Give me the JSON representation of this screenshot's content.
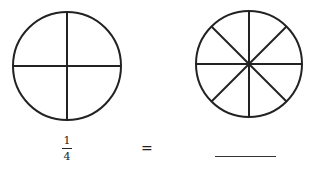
{
  "diagram": {
    "circles": [
      {
        "id": "quarters",
        "divisions": 4,
        "stroke": "#222222"
      },
      {
        "id": "eighths",
        "divisions": 8,
        "stroke": "#222222"
      }
    ],
    "equation": {
      "numerator": "1",
      "denominator": "4",
      "equals": "=",
      "answer": ""
    }
  }
}
